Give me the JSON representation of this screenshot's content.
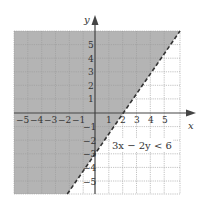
{
  "diagram": {
    "type": "linear-inequality-graph",
    "inequality_label": "3x − 2y < 6",
    "boundary_line": {
      "equation": "3x − 2y = 6",
      "style": "dashed"
    },
    "shaded_region": "above-left of boundary (y > 1.5x − 3)",
    "x_axis": {
      "label": "x",
      "min": -6,
      "max": 6,
      "tick_labels": [
        "−5",
        "−4",
        "−3",
        "−2",
        "−1",
        "1",
        "2",
        "3",
        "4",
        "5"
      ]
    },
    "y_axis": {
      "label": "y",
      "min": -6,
      "max": 6,
      "tick_labels": [
        "5",
        "4",
        "3",
        "2",
        "1",
        "−1",
        "−2",
        "−3",
        "−4",
        "−5"
      ]
    },
    "colors": {
      "shade": "#b4b4b4",
      "grid": "#9a9a9a",
      "axis": "#444444",
      "line": "#333333"
    }
  }
}
